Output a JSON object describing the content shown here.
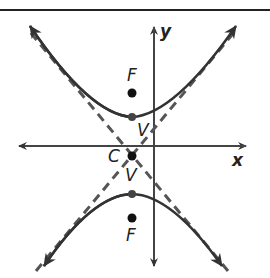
{
  "diagram": {
    "type": "hyperbola",
    "orientation": "vertical",
    "axes": {
      "x_label": "x",
      "y_label": "y"
    },
    "labels": {
      "focus_upper": "F",
      "vertex_upper": "V",
      "center": "C",
      "vertex_lower": "V",
      "focus_lower": "F"
    },
    "colors": {
      "curve": "#333333",
      "axes": "#444444",
      "asymptote": "#555555",
      "points": "#111111"
    }
  }
}
